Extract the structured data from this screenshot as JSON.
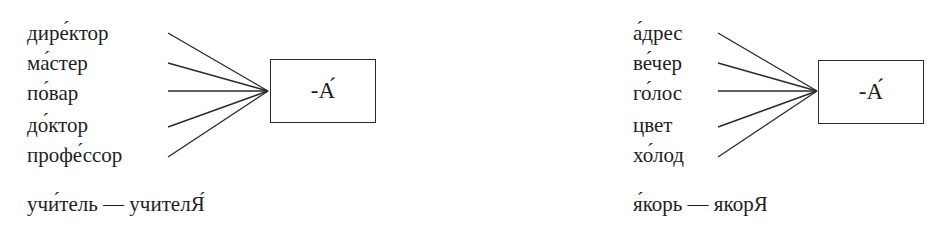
{
  "left_diagram": {
    "words": [
      "дире́ктор",
      "ма́стер",
      "по́вар",
      "до́ктор",
      "профе́ссор"
    ],
    "box_label": "-А́",
    "example": "учи́тель — учителЯ́"
  },
  "right_diagram": {
    "words": [
      "а́дрес",
      "ве́чер",
      "го́лос",
      "цвет",
      "хо́лод"
    ],
    "box_label": "-А́",
    "example": "я́корь — якорЯ"
  }
}
